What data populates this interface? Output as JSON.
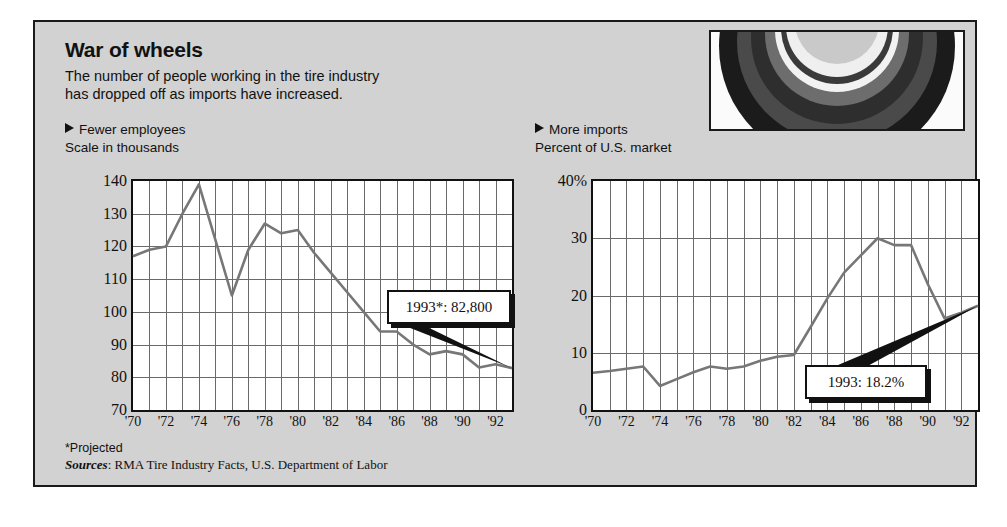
{
  "title": "War of wheels",
  "deck_line1": "The number of people working in the tire industry",
  "deck_line2": "has dropped off as imports have increased.",
  "footnote": "*Projected",
  "sources_label": "Sources",
  "sources_text": ": RMA Tire Industry Facts, U.S. Department of Labor",
  "photo": {
    "caption": "tire-photograph"
  },
  "colors": {
    "panel_background": "#d2d2d2",
    "border": "#1a1a1a",
    "plot_background": "#ffffff",
    "grid": "#6a6a6a",
    "line": "#777777",
    "text": "#111111"
  },
  "chart_data": [
    {
      "type": "line",
      "panel": "left",
      "title": "Fewer employees",
      "subtitle": "Scale in thousands",
      "xlabel": "",
      "ylabel": "Scale in thousands",
      "ylim": [
        70,
        140
      ],
      "yticks": [
        70,
        80,
        90,
        100,
        110,
        120,
        130,
        140
      ],
      "ytick_labels": [
        "70",
        "80",
        "90",
        "100",
        "110",
        "120",
        "130",
        "140"
      ],
      "xlim": [
        1970,
        1993
      ],
      "xticks": [
        1970,
        1972,
        1974,
        1976,
        1978,
        1980,
        1982,
        1984,
        1986,
        1988,
        1990,
        1992
      ],
      "xtick_labels": [
        "'70",
        "'72",
        "'74",
        "'76",
        "'78",
        "'80",
        "'82",
        "'84",
        "'86",
        "'88",
        "'90",
        "'92"
      ],
      "grid": true,
      "x": [
        1970,
        1971,
        1972,
        1973,
        1974,
        1975,
        1976,
        1977,
        1978,
        1979,
        1980,
        1981,
        1982,
        1983,
        1984,
        1985,
        1986,
        1987,
        1988,
        1989,
        1990,
        1991,
        1992,
        1993
      ],
      "values": [
        117,
        119,
        120,
        130,
        139,
        122,
        105,
        119,
        127,
        124,
        125,
        118,
        112,
        106,
        100,
        94,
        94,
        90,
        87,
        88,
        87,
        83,
        84,
        82.8
      ],
      "annotation": {
        "text": "1993*: 82,800",
        "x": 1993,
        "y": 82.8
      }
    },
    {
      "type": "line",
      "panel": "right",
      "title": "More imports",
      "subtitle": "Percent of U.S. market",
      "xlabel": "",
      "ylabel": "Percent of U.S. market",
      "ylim": [
        0,
        40
      ],
      "yticks": [
        0,
        10,
        20,
        30,
        40
      ],
      "ytick_labels": [
        "0",
        "10",
        "20",
        "30",
        "40%"
      ],
      "xlim": [
        1970,
        1993
      ],
      "xticks": [
        1970,
        1972,
        1974,
        1976,
        1978,
        1980,
        1982,
        1984,
        1986,
        1988,
        1990,
        1992
      ],
      "xtick_labels": [
        "'70",
        "'72",
        "'74",
        "'76",
        "'78",
        "'80",
        "'82",
        "'84",
        "'86",
        "'88",
        "'90",
        "'92"
      ],
      "grid": true,
      "x": [
        1970,
        1971,
        1972,
        1973,
        1974,
        1975,
        1976,
        1977,
        1978,
        1979,
        1980,
        1981,
        1982,
        1983,
        1984,
        1985,
        1986,
        1987,
        1988,
        1989,
        1990,
        1991,
        1992,
        1993
      ],
      "values": [
        6.5,
        6.8,
        7.2,
        7.6,
        4.2,
        5.4,
        6.6,
        7.6,
        7.2,
        7.6,
        8.6,
        9.3,
        9.6,
        14.5,
        19.5,
        24,
        27,
        30,
        28.8,
        28.8,
        22,
        16,
        17,
        18.2
      ],
      "annotation": {
        "text": "1993: 18.2%",
        "x": 1993,
        "y": 18.2
      }
    }
  ]
}
